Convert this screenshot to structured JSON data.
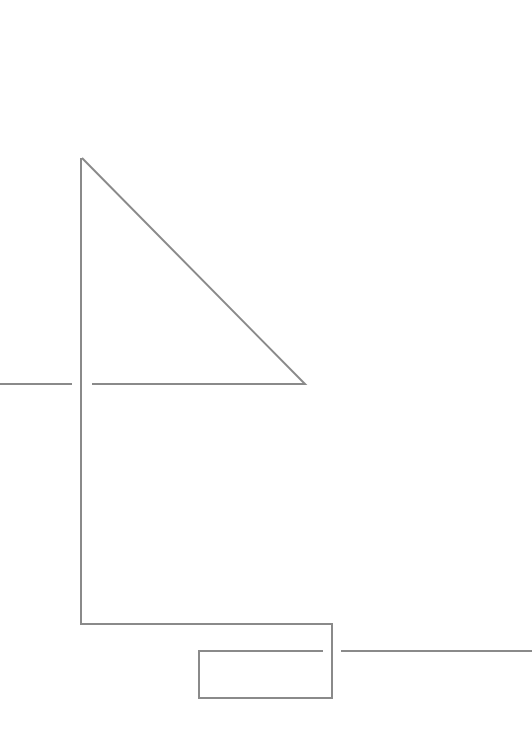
{
  "diagram": {
    "type": "line-drawing",
    "canvas": {
      "width": 532,
      "height": 740,
      "background": "#ffffff"
    },
    "stroke_color": "#8a8a8a",
    "stroke_width": 2,
    "elements": [
      {
        "id": "left-stub",
        "kind": "line",
        "points": [
          [
            0,
            384
          ],
          [
            72,
            384
          ]
        ]
      },
      {
        "id": "triangle",
        "kind": "polyline",
        "points": [
          [
            92,
            384
          ],
          [
            305,
            384
          ],
          [
            82,
            158
          ]
        ]
      },
      {
        "id": "main-path",
        "kind": "polyline",
        "points": [
          [
            81,
            158
          ],
          [
            81,
            624
          ],
          [
            332,
            624
          ],
          [
            332,
            698
          ],
          [
            199,
            698
          ],
          [
            199,
            651
          ],
          [
            323,
            651
          ]
        ]
      },
      {
        "id": "right-stub",
        "kind": "line",
        "points": [
          [
            341,
            651
          ],
          [
            532,
            651
          ]
        ]
      }
    ]
  }
}
